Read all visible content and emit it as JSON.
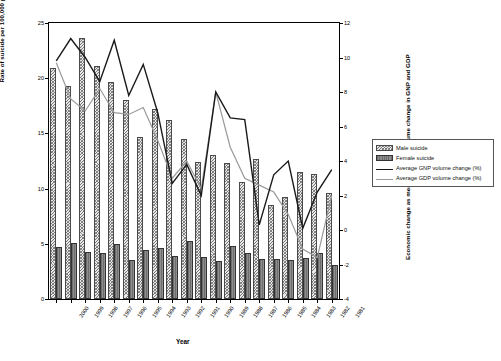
{
  "chart_data": {
    "type": "bar",
    "title": "",
    "xlabel": "Year",
    "ylabel": "Rate of suicide per 100,000 population",
    "ylabel_secondary": "Economic change as measured by % volume change in GNP and GDP",
    "categories": [
      "2000",
      "1999",
      "1998",
      "1997",
      "1996",
      "1995",
      "1994",
      "1993",
      "1992",
      "1991",
      "1990",
      "1989",
      "1988",
      "1987",
      "1986",
      "1985",
      "1984",
      "1983",
      "1982",
      "1981"
    ],
    "ylim": [
      0,
      25
    ],
    "yticks": [
      0,
      5,
      10,
      15,
      20,
      25
    ],
    "ylim_secondary": [
      -4,
      12
    ],
    "yticks_secondary": [
      -4,
      -2,
      0,
      2,
      4,
      6,
      8,
      10,
      12
    ],
    "grid": false,
    "legend_position": "right",
    "series": [
      {
        "name": "Male suicide",
        "axis": "left",
        "type": "bar",
        "color": "#e8e8e8",
        "values": [
          20.9,
          19.3,
          23.6,
          21.1,
          19.7,
          18.0,
          14.7,
          17.2,
          16.2,
          14.5,
          12.4,
          13.0,
          12.3,
          10.6,
          12.7,
          8.5,
          9.2,
          11.5,
          11.3,
          9.6
        ]
      },
      {
        "name": "Female suicide",
        "axis": "left",
        "type": "bar",
        "color": "#808080",
        "values": [
          4.7,
          5.1,
          4.3,
          4.2,
          5.0,
          3.5,
          4.4,
          4.6,
          3.9,
          5.3,
          3.8,
          3.4,
          4.8,
          4.2,
          3.6,
          3.6,
          3.5,
          3.7,
          4.2,
          3.1
        ]
      },
      {
        "name": "Average GNP volume change (%)",
        "axis": "right",
        "type": "line",
        "color": "#1a1a1a",
        "values": [
          9.8,
          11.1,
          10.0,
          8.6,
          11.0,
          7.8,
          9.6,
          6.8,
          2.7,
          3.8,
          2.0,
          8.0,
          6.5,
          6.4,
          0.3,
          3.2,
          4.0,
          0.1,
          2.2,
          3.5
        ]
      },
      {
        "name": "Average GDP volume change (%)",
        "axis": "right",
        "type": "line",
        "color": "#9a9a9a",
        "values": [
          9.7,
          7.6,
          6.9,
          8.2,
          6.8,
          6.7,
          7.1,
          5.2,
          3.0,
          4.0,
          2.4,
          8.0,
          4.8,
          3.0,
          2.6,
          2.2,
          0.9,
          -1.1,
          -1.6,
          2.0
        ]
      }
    ]
  },
  "axes": {
    "left": {
      "title": "Rate of suicide per 100,000 population",
      "ticks": [
        "25",
        "20",
        "15",
        "10",
        "5",
        "0"
      ]
    },
    "right": {
      "title": "Economic change as measured by % volume change in GNP and GDP",
      "ticks": [
        "12",
        "10",
        "8",
        "6",
        "4",
        "2",
        "0",
        "-2",
        "-4"
      ]
    },
    "bottom": {
      "title": "Year",
      "ticks": [
        "2000",
        "1999",
        "1998",
        "1997",
        "1996",
        "1995",
        "1994",
        "1993",
        "1992",
        "1991",
        "1990",
        "1989",
        "1988",
        "1987",
        "1986",
        "1985",
        "1984",
        "1983",
        "1982",
        "1981"
      ]
    }
  },
  "legend": {
    "items": [
      {
        "label": "Male suicide",
        "key": "swatch-hatched"
      },
      {
        "label": "Female suicide",
        "key": "swatch-solid-gray"
      },
      {
        "label": "Average GNP volume change (%)",
        "key": "line-black"
      },
      {
        "label": "Average GDP volume change (%)",
        "key": "line-gray"
      }
    ]
  },
  "colors": {
    "male_bar": "#e8e8e8",
    "female_bar": "#808080",
    "gnp_line": "#1a1a1a",
    "gdp_line": "#9a9a9a",
    "axis": "#000000",
    "background": "#ffffff"
  }
}
